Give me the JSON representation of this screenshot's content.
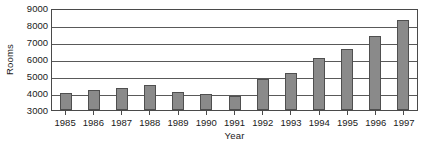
{
  "chart_data": {
    "type": "bar",
    "title": "",
    "xlabel": "Year",
    "ylabel": "Rooms",
    "categories": [
      "1985",
      "1986",
      "1987",
      "1988",
      "1989",
      "1990",
      "1991",
      "1992",
      "1993",
      "1994",
      "1995",
      "1996",
      "1997"
    ],
    "values": [
      4000,
      4180,
      4320,
      4500,
      4080,
      3960,
      3820,
      4800,
      5150,
      6050,
      6600,
      7350,
      8300
    ],
    "ylim": [
      3000,
      9000
    ],
    "yticks": [
      3000,
      4000,
      5000,
      6000,
      7000,
      8000,
      9000
    ],
    "ytick_labels": [
      "3000",
      "4000",
      "5000",
      "6000",
      "7000",
      "8000",
      "9000"
    ],
    "grid": true,
    "grid_axis": "y",
    "legend": false,
    "legend_position": "none",
    "bar_color": "#8a8a8a",
    "bar_edge_color": "#4f4f4f",
    "axis_color": "#4a4a4a",
    "grid_color": "#595959",
    "plot_background": "#ffffff",
    "text_color": "#1a1a1a"
  }
}
